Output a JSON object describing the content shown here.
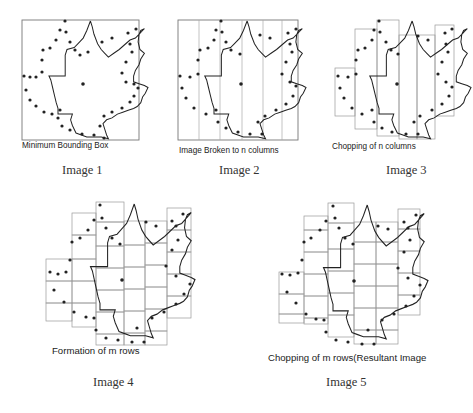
{
  "figure": {
    "panels": [
      {
        "id": 1,
        "label": "Minimum Bounding Box",
        "caption": "Image 1",
        "stage": "bounding-box"
      },
      {
        "id": 2,
        "label": "Image Broken to n columns",
        "caption": "Image 2",
        "stage": "n-columns"
      },
      {
        "id": 3,
        "label": "Chopping of n columns",
        "caption": "Image 3",
        "stage": "chopped-columns"
      },
      {
        "id": 4,
        "label": "Formation of m rows",
        "caption": "Image 4",
        "stage": "m-rows"
      },
      {
        "id": 5,
        "label": "Chopping of m rows(Resultant Image",
        "caption": "Image 5",
        "stage": "chopped-rows"
      }
    ],
    "colors": {
      "outline": "#222222",
      "grid": "#9a9a9a",
      "box": "#777777",
      "background": "#ffffff"
    }
  }
}
